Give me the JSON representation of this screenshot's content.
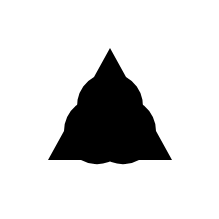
{
  "figure": {
    "type": "kanizsa-triangle",
    "background": "#ffffff",
    "fill": "#000000",
    "inducers": [
      {
        "name": "top",
        "cx": 110,
        "cy": 48,
        "r": 33,
        "notch_a": [
          94,
          77
        ],
        "notch_b": [
          126,
          77
        ]
      },
      {
        "name": "bottom-left",
        "cx": 48,
        "cy": 160,
        "r": 33,
        "notch_a": [
          81,
          160
        ],
        "notch_b": [
          64,
          131
        ]
      },
      {
        "name": "bottom-right",
        "cx": 172,
        "cy": 160,
        "r": 33,
        "notch_a": [
          156,
          131
        ],
        "notch_b": [
          139,
          160
        ]
      }
    ]
  }
}
